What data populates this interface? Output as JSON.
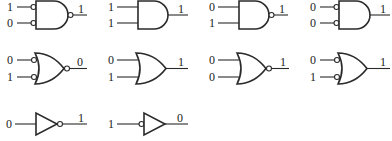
{
  "diagram": {
    "title": "",
    "stroke_color": "#2a2a2a",
    "background": "#ffffff",
    "gates": [
      {
        "id": "g1",
        "row": 0,
        "col": 0,
        "type": "AND",
        "input_bubbles": [
          true,
          true
        ],
        "output_bubble": true,
        "inputs": [
          "1",
          "0"
        ],
        "output": "1"
      },
      {
        "id": "g2",
        "row": 0,
        "col": 1,
        "type": "AND",
        "input_bubbles": [
          false,
          false
        ],
        "output_bubble": false,
        "inputs": [
          "1",
          "1"
        ],
        "output": "1"
      },
      {
        "id": "g3",
        "row": 0,
        "col": 2,
        "type": "AND",
        "input_bubbles": [
          false,
          false
        ],
        "output_bubble": true,
        "inputs": [
          "0",
          "1"
        ],
        "output": "1"
      },
      {
        "id": "g4",
        "row": 0,
        "col": 3,
        "type": "AND",
        "input_bubbles": [
          true,
          true
        ],
        "output_bubble": false,
        "inputs": [
          "0",
          "0"
        ],
        "output": "1"
      },
      {
        "id": "g5",
        "row": 1,
        "col": 0,
        "type": "OR",
        "input_bubbles": [
          true,
          true
        ],
        "output_bubble": true,
        "inputs": [
          "0",
          "1"
        ],
        "output": "0"
      },
      {
        "id": "g6",
        "row": 1,
        "col": 1,
        "type": "OR",
        "input_bubbles": [
          false,
          false
        ],
        "output_bubble": false,
        "inputs": [
          "0",
          "1"
        ],
        "output": "1"
      },
      {
        "id": "g7",
        "row": 1,
        "col": 2,
        "type": "OR",
        "input_bubbles": [
          false,
          false
        ],
        "output_bubble": true,
        "inputs": [
          "0",
          "0"
        ],
        "output": "1"
      },
      {
        "id": "g8",
        "row": 1,
        "col": 3,
        "type": "OR",
        "input_bubbles": [
          true,
          true
        ],
        "output_bubble": false,
        "inputs": [
          "0",
          "1"
        ],
        "output": "1"
      },
      {
        "id": "g9",
        "row": 2,
        "col": 0,
        "type": "BUF",
        "input_bubbles": [
          false
        ],
        "output_bubble": true,
        "inputs": [
          "0"
        ],
        "output": "1"
      },
      {
        "id": "g10",
        "row": 2,
        "col": 1,
        "type": "BUF",
        "input_bubbles": [
          true
        ],
        "output_bubble": false,
        "inputs": [
          "1"
        ],
        "output": "0"
      }
    ]
  }
}
